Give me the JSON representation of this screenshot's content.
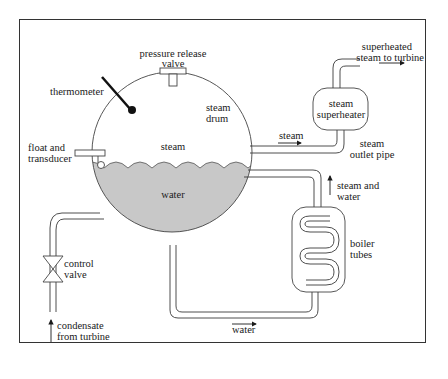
{
  "diagram": {
    "type": "boiler steam drum schematic",
    "colors": {
      "line": "#3a3a3a",
      "water": "#c8c8c8",
      "frame": "#333333",
      "background": "#ffffff"
    },
    "labels": {
      "pressure_release_valve_1": "pressure release",
      "pressure_release_valve_2": "valve",
      "thermometer": "thermometer",
      "steam_drum_1": "steam",
      "steam_drum_2": "drum",
      "float_1": "float and",
      "float_2": "transducer",
      "steam_space": "steam",
      "water": "water",
      "superheated_1": "superheated",
      "superheated_2": "steam to turbine",
      "superheater_1": "steam",
      "superheater_2": "superheater",
      "steam_flow": "steam",
      "outlet_1": "steam",
      "outlet_2": "outlet pipe",
      "steam_water_1": "steam and",
      "steam_water_2": "water",
      "boiler_tubes_1": "boiler",
      "boiler_tubes_2": "tubes",
      "control_valve_1": "control",
      "control_valve_2": "valve",
      "condensate_1": "condensate",
      "condensate_2": "from turbine",
      "water_return": "water"
    }
  }
}
